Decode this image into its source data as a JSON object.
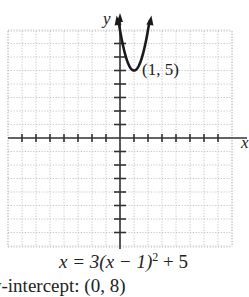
{
  "chart_data": {
    "type": "line",
    "title": "",
    "equation": "x = 3(x − 1)² + 5",
    "xlabel": "x",
    "ylabel": "y",
    "xlim": [
      -8,
      8
    ],
    "ylim": [
      -8,
      8
    ],
    "grid": true,
    "series": [
      {
        "name": "parabola",
        "function": "y = 3(x - 1)^2 + 5",
        "x": [
          -0.1,
          0,
          0.25,
          0.5,
          0.75,
          1,
          1.25,
          1.5,
          1.75,
          2,
          2.1
        ],
        "values": [
          8.63,
          8,
          6.69,
          5.75,
          5.19,
          5,
          5.19,
          5.75,
          6.69,
          8,
          8.63
        ]
      }
    ],
    "annotations": [
      {
        "text": "(1, 5)",
        "x": 1,
        "y": 5
      }
    ]
  },
  "labels": {
    "y_axis": "y",
    "x_axis": "x",
    "vertex": "(1, 5)",
    "equation_main": "x = 3(x − 1)",
    "equation_exp": "2",
    "equation_tail": " + 5",
    "note": "y-intercept: (0, 8)"
  }
}
